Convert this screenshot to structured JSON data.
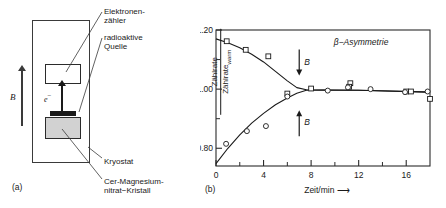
{
  "figure": {
    "panel_a": {
      "caption": "(a)",
      "bfield_label": "B",
      "electron_label": "e",
      "electron_superscript": "−",
      "annotations": [
        {
          "name": "electron-counter",
          "lines": [
            "Elektronen-",
            "zähler"
          ]
        },
        {
          "name": "radioactive-source",
          "lines": [
            "radioaktive",
            "Quelle"
          ]
        },
        {
          "name": "cryostat",
          "lines": [
            "Kryostat"
          ]
        },
        {
          "name": "crystal",
          "lines": [
            "Cer-Magnesium-",
            "nitrat−Kristall"
          ]
        }
      ]
    },
    "panel_b": {
      "caption": "(b)"
    }
  },
  "chart_data": {
    "type": "scatter",
    "title": "β−Asymmetrie",
    "xlabel": "Zeit/min ⟶",
    "ylabel_numerator": "Zählrate",
    "ylabel_denominator": "Zählrate",
    "ylabel_denominator_sub": "warm",
    "xlim": [
      0,
      18
    ],
    "ylim": [
      0.74,
      1.2
    ],
    "xticks_major": [
      0,
      4,
      8,
      12,
      16
    ],
    "xticks_minor": [
      2,
      6,
      10,
      14
    ],
    "xtick_labels": [
      "0",
      "4",
      "8",
      "12",
      "16"
    ],
    "yticks_major": [
      0.8,
      1.0,
      1.2
    ],
    "yticks_minor": [
      0.9,
      1.1
    ],
    "ytick_labels": [
      "0.80",
      "1.00",
      "1.20"
    ],
    "grid": false,
    "legend": false,
    "annotations": [
      {
        "name": "beta-arrow-down",
        "label": "B",
        "x": 7.0,
        "y": 1.09,
        "direction": "down"
      },
      {
        "name": "beta-arrow-up",
        "label": "B",
        "x": 7.0,
        "y": 0.885,
        "direction": "up"
      }
    ],
    "series": [
      {
        "name": "antiparallel (squares)",
        "marker": "square",
        "points": [
          [
            0.9,
            1.162
          ],
          [
            2.5,
            1.133
          ],
          [
            4.4,
            1.111
          ],
          [
            6.0,
            0.985
          ],
          [
            8.0,
            1.002
          ],
          [
            11.3,
            1.02
          ],
          [
            11.2,
            1.008
          ],
          [
            16.0,
            0.992
          ],
          [
            16.4,
            0.992
          ],
          [
            18.0,
            0.967
          ]
        ]
      },
      {
        "name": "parallel (circles)",
        "marker": "circle",
        "points": [
          [
            0.85,
            0.815
          ],
          [
            2.6,
            0.858
          ],
          [
            4.2,
            0.875
          ],
          [
            6.0,
            0.975
          ],
          [
            9.4,
            0.995
          ],
          [
            11.1,
            1.006
          ],
          [
            13.0,
            1.0
          ],
          [
            15.9,
            0.99
          ],
          [
            17.8,
            0.992
          ]
        ]
      }
    ],
    "fit_curves": [
      {
        "name": "upper-fit",
        "points": [
          [
            0.0,
            1.17
          ],
          [
            1.0,
            1.157
          ],
          [
            2.0,
            1.14
          ],
          [
            3.0,
            1.118
          ],
          [
            4.0,
            1.092
          ],
          [
            5.0,
            1.06
          ],
          [
            6.0,
            1.028
          ],
          [
            6.8,
            1.005
          ],
          [
            7.6,
            0.998
          ],
          [
            9.0,
            0.997
          ],
          [
            12.0,
            0.996
          ],
          [
            18.0,
            0.99
          ]
        ]
      },
      {
        "name": "lower-fit",
        "points": [
          [
            0.0,
            0.748
          ],
          [
            1.0,
            0.8
          ],
          [
            2.0,
            0.845
          ],
          [
            3.0,
            0.885
          ],
          [
            4.0,
            0.918
          ],
          [
            5.0,
            0.947
          ],
          [
            6.0,
            0.97
          ],
          [
            6.8,
            0.986
          ],
          [
            7.6,
            0.996
          ],
          [
            9.0,
            0.997
          ],
          [
            12.0,
            0.996
          ],
          [
            18.0,
            0.99
          ]
        ]
      }
    ]
  }
}
